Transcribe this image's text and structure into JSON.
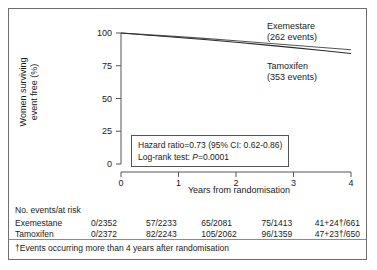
{
  "chart_data": {
    "type": "line",
    "title": "",
    "xlabel": "Years from randomisation",
    "ylabel_line1": "Women surviving",
    "ylabel_line2": "event free (%)",
    "xlim": [
      0,
      4
    ],
    "ylim": [
      0,
      100
    ],
    "xticks": [
      "0",
      "1",
      "2",
      "3",
      "4"
    ],
    "yticks": [
      "0",
      "25",
      "50",
      "75",
      "100"
    ],
    "grid": false,
    "legend_position": "in-plot-right",
    "series": [
      {
        "name": "Exemestare",
        "events_label": "(262 events)",
        "events": 262,
        "color": "#555555",
        "x": [
          0,
          0.5,
          1,
          1.5,
          2,
          2.5,
          3,
          3.5,
          4
        ],
        "values": [
          100,
          98.6,
          97.2,
          95.7,
          94.1,
          92.4,
          90.6,
          88.9,
          87.2
        ]
      },
      {
        "name": "Tamoxifen",
        "events_label": "(353 events)",
        "events": 353,
        "color": "#2b2b2b",
        "x": [
          0,
          0.5,
          1,
          1.5,
          2,
          2.5,
          3,
          3.5,
          4
        ],
        "values": [
          100,
          98.3,
          96.6,
          94.8,
          92.9,
          90.9,
          88.8,
          86.6,
          84.4
        ]
      }
    ],
    "annotations": {
      "hazard_ratio": "Hazard ratio=0.73 (95% CI: 0.62-0.86)",
      "logrank_prefix": "Log-rank test: ",
      "logrank_p_italic": "P",
      "logrank_p_value": "=0.0001"
    }
  },
  "risk_table": {
    "title": "No. events/at risk",
    "rows": [
      {
        "label": "Exemestane",
        "cells": [
          "0/2352",
          "57/2233",
          "65/2081",
          "75/1413",
          "41+24†/661"
        ]
      },
      {
        "label": "Tamoxifen",
        "cells": [
          "0/2372",
          "82/2243",
          "105/2062",
          "96/1359",
          "47+23†/650"
        ]
      }
    ]
  },
  "footnote": "†Events occurring more than 4 years after randomisation",
  "colors": {
    "frame": "#6f6f6f",
    "axis": "#555555",
    "text": "#1a1a1a",
    "series_top": "#555555",
    "series_bottom": "#2b2b2b"
  }
}
